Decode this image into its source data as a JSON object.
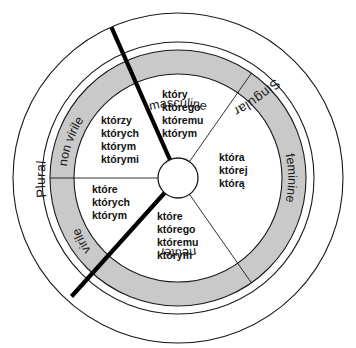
{
  "figure": {
    "colors": {
      "ring_fill": "#c9c9c9",
      "background": "#ffffff",
      "stroke": "#1a1a1a",
      "thick_divider": "#000000",
      "text": "#111111"
    }
  },
  "outer_ring": {
    "labels": [
      {
        "id": "singular",
        "text": "Singular",
        "position": "upper-right"
      },
      {
        "id": "plural",
        "text": "Plural",
        "position": "left"
      }
    ]
  },
  "gender_ring": {
    "labels": [
      {
        "id": "masculine",
        "text": "masculine",
        "position": "top"
      },
      {
        "id": "feminine",
        "text": "feminine",
        "position": "right"
      },
      {
        "id": "neuter",
        "text": "neuter",
        "position": "bottom"
      },
      {
        "id": "non-virile",
        "text": "non virile",
        "position": "upper-left"
      },
      {
        "id": "virile",
        "text": "virile",
        "position": "lower-left"
      }
    ]
  },
  "sectors": [
    {
      "id": "masculine-singular",
      "gender": "masculine",
      "number": "Singular",
      "forms": [
        "który",
        "którego",
        "któremu",
        "którym"
      ]
    },
    {
      "id": "feminine-singular",
      "gender": "feminine",
      "number": "Singular",
      "forms": [
        "która",
        "której",
        "którą"
      ]
    },
    {
      "id": "neuter-singular",
      "gender": "neuter",
      "number": "Singular",
      "forms": [
        "które",
        "którego",
        "któremu",
        "którym"
      ]
    },
    {
      "id": "non-virile-plural",
      "gender": "non virile",
      "number": "Plural",
      "forms": [
        "którzy",
        "których",
        "którym",
        "którymi"
      ]
    },
    {
      "id": "virile-plural",
      "gender": "virile",
      "number": "Plural",
      "forms": [
        "które",
        "których",
        "którym"
      ]
    }
  ]
}
